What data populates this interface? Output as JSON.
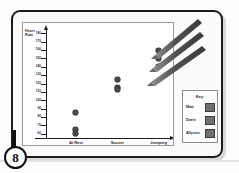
{
  "page": {
    "badge_number": "8"
  },
  "chart_data": {
    "type": "scatter",
    "title": "",
    "ylabel": "Heart\nRate",
    "ylabel_line1": "Heart",
    "ylabel_line2": "Rate",
    "xlabel": "",
    "categories": [
      "At Rest",
      "Soccer",
      "Jumping Rope"
    ],
    "category_labels": [
      {
        "line1": "At Rest",
        "line2": ""
      },
      {
        "line1": "Soccer",
        "line2": ""
      },
      {
        "line1": "Jumping",
        "line2": "Rope"
      }
    ],
    "ytick_labels": [
      "180",
      "170",
      "160",
      "150",
      "140",
      "130",
      "120",
      "110",
      "100",
      "90",
      "80",
      "70",
      "60"
    ],
    "ylim": [
      55,
      185
    ],
    "grid": false,
    "legend_position": "right-outside",
    "series": [
      {
        "name": "Matt",
        "swatch": "#6f6f6f",
        "values": [
          85,
          125,
          160
        ]
      },
      {
        "name": "Darin",
        "swatch": "#6f6f6f",
        "values": [
          65,
          115,
          150
        ]
      },
      {
        "name": "Allyson",
        "swatch": "#6f6f6f",
        "values": [
          60,
          113,
          140
        ]
      }
    ],
    "points": [
      {
        "category": "At Rest",
        "value": 85
      },
      {
        "category": "At Rest",
        "value": 65
      },
      {
        "category": "At Rest",
        "value": 60
      },
      {
        "category": "Soccer",
        "value": 125
      },
      {
        "category": "Soccer",
        "value": 115
      },
      {
        "category": "Soccer",
        "value": 113
      },
      {
        "category": "Jumping Rope",
        "value": 160
      },
      {
        "category": "Jumping Rope",
        "value": 150
      },
      {
        "category": "Jumping Rope",
        "value": 140
      }
    ],
    "marker_color": "#4a4a4a"
  },
  "key": {
    "title": "Key:",
    "entries": [
      {
        "label": "Matt",
        "color": "#6f6f6f"
      },
      {
        "label": "Darin",
        "color": "#6f6f6f"
      },
      {
        "label": "Allyson",
        "color": "#6f6f6f"
      }
    ]
  },
  "annotations": {
    "stroke_color": "#555555",
    "strokes": [
      {
        "name": "pencil-stroke-1"
      },
      {
        "name": "pencil-stroke-2"
      },
      {
        "name": "pencil-stroke-3"
      }
    ]
  }
}
